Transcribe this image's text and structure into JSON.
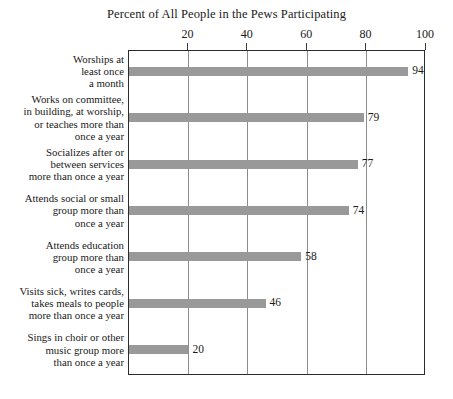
{
  "chart_data": {
    "type": "bar",
    "orientation": "horizontal",
    "title": "Percent of All People in the Pews Participating",
    "xlabel": "",
    "ylabel": "",
    "xlim": [
      0,
      100
    ],
    "xticks": [
      20,
      40,
      60,
      80,
      100
    ],
    "xtick_labels": [
      "20",
      "40",
      "60",
      "80",
      "100"
    ],
    "grid": true,
    "grid_axis": "x",
    "legend": "none",
    "bar_color": "#999999",
    "frame_color": "#2b2b2b",
    "gridline_color": "#8c8c8c",
    "categories": [
      "Worships at least once a month",
      "Works on committee, in building, at worship, or teaches more than once a year",
      "Socializes after or between services more than once a year",
      "Attends social or small group more than once a year",
      "Attends education group more than once a year",
      "Visits sick, writes cards, takes meals to people more than once a year",
      "Sings in choir or other music group more than once a year"
    ],
    "category_lines": [
      [
        "Worships at",
        "least once",
        "a month"
      ],
      [
        "Works on committee,",
        "in building, at worship,",
        "or teaches more than",
        "once a year"
      ],
      [
        "Socializes after or",
        "between services",
        "more than once a year"
      ],
      [
        "Attends social or small",
        "group more than",
        "once a year"
      ],
      [
        "Attends education",
        "group more than",
        "once a year"
      ],
      [
        "Visits sick, writes cards,",
        "takes meals to people",
        "more than once a year"
      ],
      [
        "Sings in choir or other",
        "music group more",
        "than once a year"
      ]
    ],
    "values": [
      94,
      79,
      77,
      74,
      58,
      46,
      20
    ],
    "value_labels": [
      "94",
      "79",
      "77",
      "74",
      "58",
      "46",
      "20"
    ]
  }
}
